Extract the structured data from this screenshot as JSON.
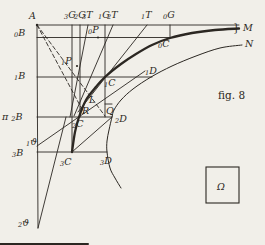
{
  "canvas": {
    "width": 265,
    "height": 245
  },
  "colors": {
    "ink": "#2b2722",
    "paper": "#f1efe9"
  },
  "caption": "fig. 8",
  "labels": [
    {
      "id": "A",
      "main": "A",
      "x": 29,
      "y": 19
    },
    {
      "id": "3G",
      "sub": "3",
      "main": "G",
      "x": 64,
      "y": 18
    },
    {
      "id": "2G",
      "sub": "2",
      "main": "G",
      "x": 74,
      "y": 18
    },
    {
      "id": "3T",
      "sub": "3",
      "main": "T",
      "x": 82,
      "y": 18
    },
    {
      "id": "1G",
      "sub": "1",
      "main": "G",
      "x": 98,
      "y": 18
    },
    {
      "id": "2T",
      "sub": "2",
      "main": "T",
      "x": 107,
      "y": 18
    },
    {
      "id": "1T",
      "sub": "1",
      "main": "T",
      "x": 141,
      "y": 18
    },
    {
      "id": "0G",
      "sub": "0",
      "main": "G",
      "x": 163,
      "y": 18
    },
    {
      "id": "brace",
      "main": "}",
      "x": 233,
      "y": 31,
      "plain": true,
      "size": 12
    },
    {
      "id": "M",
      "main": "M",
      "x": 243,
      "y": 31
    },
    {
      "id": "N",
      "main": "N",
      "x": 245,
      "y": 47
    },
    {
      "id": "0B",
      "sub": "0",
      "main": "B",
      "x": 14,
      "y": 36
    },
    {
      "id": "1B",
      "sub": "1",
      "main": "B",
      "x": 14,
      "y": 79
    },
    {
      "id": "pi2B",
      "pre": "π ",
      "sub": "2",
      "main": "B",
      "x": 2,
      "y": 120
    },
    {
      "id": "1theta",
      "sub": "1",
      "main": "ϑ",
      "x": 26,
      "y": 145
    },
    {
      "id": "3B",
      "sub": "3",
      "main": "B",
      "x": 12,
      "y": 156
    },
    {
      "id": "2theta",
      "sub": "2",
      "main": "ϑ",
      "x": 18,
      "y": 226
    },
    {
      "id": "0P",
      "sub": "0",
      "main": "P",
      "x": 88,
      "y": 33
    },
    {
      "id": "1P",
      "sub": "1",
      "main": "P",
      "x": 61,
      "y": 64
    },
    {
      "id": "0C",
      "sub": "0",
      "main": "C",
      "x": 158,
      "y": 47
    },
    {
      "id": "1C",
      "sub": "1",
      "main": "C",
      "x": 104,
      "y": 86
    },
    {
      "id": "2C",
      "sub": "2",
      "main": "C",
      "x": 72,
      "y": 127
    },
    {
      "id": "3C",
      "sub": "3",
      "main": "C",
      "x": 60,
      "y": 165
    },
    {
      "id": "1D",
      "sub": "1",
      "main": "D",
      "x": 145,
      "y": 74
    },
    {
      "id": "2D",
      "sub": "2",
      "main": "D",
      "x": 115,
      "y": 122
    },
    {
      "id": "3D",
      "sub": "3",
      "main": "D",
      "x": 100,
      "y": 164
    },
    {
      "id": "L",
      "main": "L",
      "x": 89,
      "y": 103
    },
    {
      "id": "R",
      "main": "R",
      "x": 82,
      "y": 114
    },
    {
      "id": "Q",
      "main": "Q",
      "x": 106,
      "y": 114
    },
    {
      "id": "omega",
      "main": "Ω",
      "x": 217,
      "y": 190,
      "size": 12
    },
    {
      "id": "caption",
      "main": "fig. 8",
      "x": 218,
      "y": 99,
      "plain": true,
      "size": 11
    }
  ],
  "lines": [
    {
      "id": "axis-vertical",
      "x1": 37,
      "y1": 25,
      "x2": 38,
      "y2": 228
    },
    {
      "id": "top-horizontal",
      "x1": 37,
      "y1": 25,
      "x2": 239,
      "y2": 25
    },
    {
      "id": "h-line-0B",
      "x1": 37,
      "y1": 37.5,
      "x2": 170,
      "y2": 37.5
    },
    {
      "id": "h-line-1B",
      "x1": 37,
      "y1": 77,
      "x2": 152,
      "y2": 77
    },
    {
      "id": "h-line-2B",
      "x1": 37,
      "y1": 117,
      "x2": 112,
      "y2": 117
    },
    {
      "id": "h-line-3B",
      "x1": 37,
      "y1": 152,
      "x2": 107,
      "y2": 152
    },
    {
      "id": "v-line-0G",
      "x1": 170,
      "y1": 25,
      "x2": 170,
      "y2": 38
    },
    {
      "id": "v-line-1G",
      "x1": 105,
      "y1": 25,
      "x2": 105,
      "y2": 117
    },
    {
      "id": "v-line-2G",
      "x1": 80,
      "y1": 25,
      "x2": 80,
      "y2": 117
    },
    {
      "id": "v-line-3G",
      "x1": 72,
      "y1": 25,
      "x2": 72,
      "y2": 152
    },
    {
      "id": "tangent-1T",
      "x1": 147,
      "y1": 25,
      "x2": 78,
      "y2": 112
    },
    {
      "id": "tangent-2T",
      "x1": 113,
      "y1": 25,
      "x2": 74,
      "y2": 116
    },
    {
      "id": "tangent-3T",
      "x1": 88,
      "y1": 25,
      "x2": 70,
      "y2": 117
    },
    {
      "id": "chord-2D-3C",
      "x1": 112,
      "y1": 117,
      "x2": 72,
      "y2": 152
    },
    {
      "id": "theta1-tangent",
      "x1": 37,
      "y1": 146,
      "x2": 145,
      "y2": 71
    },
    {
      "id": "theta2-tangent",
      "x1": 38,
      "y1": 228,
      "x2": 66,
      "y2": 117
    },
    {
      "id": "q-box-top",
      "x1": 105,
      "y1": 104,
      "x2": 112,
      "y2": 104
    },
    {
      "id": "dashed-chord-A-R",
      "x1": 37,
      "y1": 25,
      "x2": 84,
      "y2": 113,
      "dashed": true
    },
    {
      "id": "dashed-chord-A-Q",
      "x1": 37,
      "y1": 25,
      "x2": 105,
      "y2": 116,
      "dashed": true
    },
    {
      "id": "scan-edge-artifact",
      "x1": 0,
      "y1": 244,
      "x2": 88,
      "y2": 244,
      "w": 2
    }
  ],
  "curves": [
    {
      "id": "solution-curve-C",
      "width": 2.3,
      "points": [
        [
          239,
          28.5
        ],
        [
          215,
          30
        ],
        [
          192,
          33
        ],
        [
          170,
          38
        ],
        [
          152,
          45
        ],
        [
          136,
          54
        ],
        [
          121,
          64
        ],
        [
          105,
          77
        ],
        [
          95,
          88
        ],
        [
          86,
          100
        ],
        [
          79,
          117
        ],
        [
          75,
          132
        ],
        [
          72,
          152
        ]
      ]
    },
    {
      "id": "approximation-curve-D",
      "width": 1,
      "points": [
        [
          242,
          45
        ],
        [
          220,
          48
        ],
        [
          196,
          56
        ],
        [
          172,
          66
        ],
        [
          151,
          77
        ],
        [
          133,
          89
        ],
        [
          121,
          100
        ],
        [
          114,
          110
        ],
        [
          112,
          117
        ],
        [
          109,
          130
        ],
        [
          107,
          141
        ],
        [
          107,
          152
        ],
        [
          110,
          168
        ],
        [
          115,
          178
        ],
        [
          121,
          188
        ]
      ]
    }
  ],
  "boxes": [
    {
      "id": "omega-box",
      "x": 206,
      "y": 167,
      "w": 33,
      "h": 36
    }
  ],
  "dots": [
    {
      "id": "point-A",
      "x": 37,
      "y": 25,
      "r": 1.2
    },
    {
      "id": "point-0P",
      "x": 98,
      "y": 37.5,
      "r": 1.1
    },
    {
      "id": "point-1P",
      "x": 77,
      "y": 66,
      "r": 1.1
    }
  ]
}
